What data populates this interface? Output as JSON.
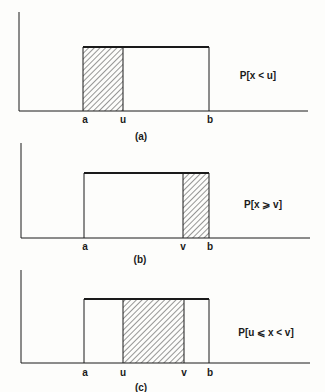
{
  "figure": {
    "colors": {
      "ink": "#1a1a1a",
      "background": "#fdfdfb"
    },
    "panels": [
      {
        "id": "a",
        "caption": "(a)",
        "probability_label": "P[x < u]",
        "tick_labels": {
          "a": "a",
          "u": "u",
          "b": "b"
        },
        "shaded_region": "a to u"
      },
      {
        "id": "b",
        "caption": "(b)",
        "probability_label": "P[x ⩾ v]",
        "tick_labels": {
          "a": "a",
          "v": "v",
          "b": "b"
        },
        "shaded_region": "v to b"
      },
      {
        "id": "c",
        "caption": "(c)",
        "probability_label": "P[u ⩽ x < v]",
        "tick_labels": {
          "a": "a",
          "u": "u",
          "v": "v",
          "b": "b"
        },
        "shaded_region": "u to v"
      }
    ]
  }
}
